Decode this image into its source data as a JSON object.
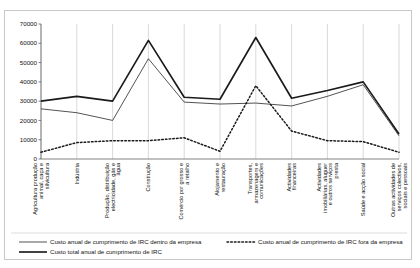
{
  "chart_data": {
    "type": "line",
    "title": "",
    "xlabel": "",
    "ylabel": "",
    "ylim": [
      0,
      70000
    ],
    "ytick_step": 10000,
    "grid": true,
    "grid_axis": "x",
    "legend_position": "bottom",
    "yticks": [
      "0",
      "10000",
      "20000",
      "30000",
      "40000",
      "50000",
      "60000",
      "70000"
    ],
    "categories": [
      "Agricultura produção animal, caça e silvicultura",
      "Indústria",
      "Produção, distribuição electricidade, gás e água",
      "Construção",
      "Comércio por grosso e a retalho",
      "Alojamento e restauração",
      "Transportes, armazenagem e comunicações",
      "Actividades financeiras",
      "Actividades imobiliárias, aluguer e outros serviços presta",
      "Saúde e acção social",
      "Outras actividades de serviços colectivos, sociais e pessoais"
    ],
    "series": [
      {
        "name": "Custo anual de cumprimento de IRC dentro da empresa",
        "style": "thin-solid",
        "color": "#1a1a1a",
        "values": [
          26000,
          24000,
          20000,
          52000,
          29500,
          28500,
          29000,
          27500,
          32500,
          38500,
          12000
        ]
      },
      {
        "name": "Custo anual de cumprimento de IRC fora da empresa",
        "style": "dotted",
        "color": "#1a1a1a",
        "values": [
          3500,
          8500,
          9500,
          9500,
          11000,
          4000,
          38000,
          14500,
          9500,
          9000,
          3500
        ]
      },
      {
        "name": "Custo total anual de cumprimento de IRC",
        "style": "thick-solid",
        "color": "#1a1a1a",
        "values": [
          30000,
          32500,
          30000,
          61500,
          32000,
          31000,
          63000,
          31500,
          35500,
          40000,
          13000
        ]
      }
    ]
  },
  "legend": {
    "items": [
      {
        "label": "Custo anual de cumprimento de IRC dentro da empresa",
        "style": "thin-solid"
      },
      {
        "label": "Custo anual de cumprimento de IRC fora da empresa",
        "style": "dotted"
      },
      {
        "label": "Custo total anual de cumprimento de IRC",
        "style": "thick-solid"
      }
    ]
  }
}
